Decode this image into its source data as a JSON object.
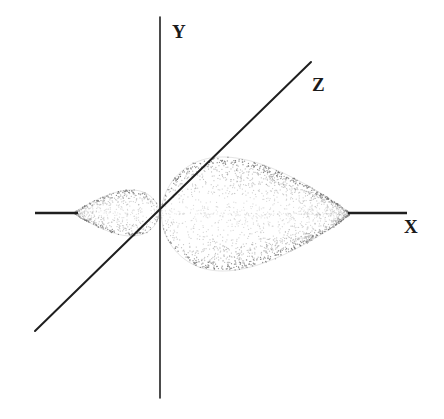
{
  "figure": {
    "background_color": "#ffffff",
    "width": 444,
    "height": 419,
    "axis_color": "#1f1f1f",
    "lobe_stipple_color": "#8c8c8c",
    "lobe_edge_color": "#6e6e6e"
  },
  "axes": [
    {
      "id": "y-axis",
      "label": "Y",
      "label_x": 172,
      "label_y": 38,
      "x1": 160,
      "y1": 17,
      "x2": 160,
      "y2": 398,
      "stroke_width": 1.6
    },
    {
      "id": "z-axis",
      "label": "Z",
      "label_x": 312,
      "label_y": 91,
      "x1": 35,
      "y1": 331,
      "x2": 311,
      "y2": 62,
      "stroke_width": 2.0
    },
    {
      "id": "x-axis-left-segment",
      "label": "",
      "label_x": 0,
      "label_y": 0,
      "x1": 35,
      "y1": 213,
      "x2": 78,
      "y2": 213,
      "stroke_width": 2.6
    },
    {
      "id": "x-axis-right-segment",
      "label": "X",
      "label_x": 404,
      "label_y": 233,
      "x1": 348,
      "y1": 213,
      "x2": 407,
      "y2": 213,
      "stroke_width": 2.6
    }
  ],
  "lobes": [
    {
      "id": "major-lobe",
      "name": "large-lobe-positive-x",
      "orientation": "points-left-to-origin",
      "tip_x": 161,
      "tip_y": 212,
      "far_x": 350,
      "far_y": 213,
      "top_y": 157,
      "bottom_y": 271,
      "max_half_height": 57,
      "widest_x": 288
    },
    {
      "id": "minor-lobe",
      "name": "small-lobe-negative-x",
      "orientation": "points-right-to-origin",
      "tip_x": 159,
      "tip_y": 212,
      "far_x": 74,
      "far_y": 213,
      "top_y": 190,
      "bottom_y": 236,
      "max_half_height": 23,
      "widest_x": 100
    }
  ],
  "stipple": {
    "major_point_count": 2100,
    "minor_point_count": 620,
    "dot_radius": 0.62,
    "edge_band_boost": 3.0
  }
}
